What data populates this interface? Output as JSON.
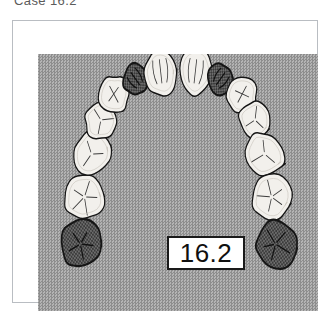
{
  "caption": {
    "text": "Case 16.2"
  },
  "figure": {
    "panel_background_color": "#9b9b9b",
    "frame_border_color": "#b9bdc2",
    "value_box": {
      "value": "16.2",
      "border_color": "#1a1a1a",
      "fill_color": "#ffffff"
    },
    "diagram_type": "maxillary-dental-arch-occlusal-view",
    "tooth_fill_light": "#f2f0ec",
    "tooth_fill_dark": "#6d6d6d",
    "tooth_outline": "#151515",
    "teeth": [
      {
        "id": "UR7",
        "name": "upper-right-second-molar",
        "shade": "dark",
        "cx": 54,
        "cy": 190,
        "rx": 26,
        "ry": 25,
        "rot": -8
      },
      {
        "id": "UR6",
        "name": "upper-right-first-molar",
        "shade": "light",
        "cx": 59,
        "cy": 143,
        "rx": 27,
        "ry": 24,
        "rot": -14
      },
      {
        "id": "UR5",
        "name": "upper-right-second-premolar",
        "shade": "light",
        "cx": 68,
        "cy": 100,
        "rx": 26,
        "ry": 23,
        "rot": -20
      },
      {
        "id": "UR4",
        "name": "upper-right-first-premolar",
        "shade": "light",
        "cx": 80,
        "cy": 66,
        "rx": 21,
        "ry": 19,
        "rot": -26
      },
      {
        "id": "UR3",
        "name": "upper-right-canine",
        "shade": "light",
        "cx": 97,
        "cy": 41,
        "rx": 20,
        "ry": 19,
        "rot": -34
      },
      {
        "id": "UR2",
        "name": "upper-right-lateral-incisor",
        "shade": "dark",
        "cx": 124,
        "cy": 25,
        "rx": 17,
        "ry": 16,
        "rot": -42
      },
      {
        "id": "UR1",
        "name": "upper-right-central-incisor",
        "shade": "light",
        "cx": 156,
        "cy": 18,
        "rx": 21,
        "ry": 24,
        "rot": -8
      },
      {
        "id": "UL1",
        "name": "upper-left-central-incisor",
        "shade": "light",
        "cx": 200,
        "cy": 18,
        "rx": 21,
        "ry": 24,
        "rot": 8
      },
      {
        "id": "UL2",
        "name": "upper-left-lateral-incisor",
        "shade": "dark",
        "cx": 232,
        "cy": 25,
        "rx": 17,
        "ry": 16,
        "rot": 42
      },
      {
        "id": "UL3",
        "name": "upper-left-canine",
        "shade": "light",
        "cx": 259,
        "cy": 41,
        "rx": 20,
        "ry": 19,
        "rot": 34
      },
      {
        "id": "UL4",
        "name": "upper-left-first-premolar",
        "shade": "light",
        "cx": 276,
        "cy": 66,
        "rx": 21,
        "ry": 19,
        "rot": 26
      },
      {
        "id": "UL5",
        "name": "upper-left-second-premolar",
        "shade": "light",
        "cx": 288,
        "cy": 100,
        "rx": 26,
        "ry": 23,
        "rot": 20
      },
      {
        "id": "UL6",
        "name": "upper-left-first-molar",
        "shade": "light",
        "cx": 297,
        "cy": 143,
        "rx": 27,
        "ry": 24,
        "rot": 14
      },
      {
        "id": "UL7",
        "name": "upper-left-second-molar",
        "shade": "dark",
        "cx": 302,
        "cy": 190,
        "rx": 26,
        "ry": 25,
        "rot": 8
      }
    ]
  }
}
